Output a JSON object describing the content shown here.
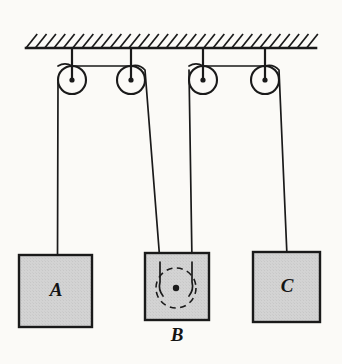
{
  "figure": {
    "background_color": "#fbfaf7",
    "ink_color": "#1a1a1a",
    "block_fill_color": "#d3d3d3",
    "width": 342,
    "height": 364
  },
  "ceiling": {
    "name": "ceiling-support",
    "label": "ceiling",
    "x_left": 26,
    "x_right": 316,
    "y_line": 48,
    "band_height": 14,
    "hatch_count": 31,
    "hatch_direction": "up-right"
  },
  "pulleys": [
    {
      "id": "pulley-1",
      "label": "1",
      "cx": 72,
      "cy": 80,
      "r": 14,
      "hub_r": 2.6,
      "rod_top_y": 48
    },
    {
      "id": "pulley-2",
      "label": "2",
      "cx": 131,
      "cy": 80,
      "r": 14,
      "hub_r": 2.6,
      "rod_top_y": 48
    },
    {
      "id": "pulley-3",
      "label": "3",
      "cx": 203,
      "cy": 80,
      "r": 14,
      "hub_r": 2.6,
      "rod_top_y": 48
    },
    {
      "id": "pulley-4",
      "label": "4",
      "cx": 265,
      "cy": 80,
      "r": 14,
      "hub_r": 2.6,
      "rod_top_y": 48
    }
  ],
  "hidden_pulley": {
    "id": "hidden-pulley-in-B",
    "label": "movable pulley inside B",
    "cx": 176,
    "cy": 288,
    "r": 20,
    "hub_r": 3.2,
    "style": "dashed"
  },
  "strings": [
    {
      "id": "string-left",
      "label": "string over pulleys 1 and 2",
      "path": "M 58,82 L 57.5,258  M 58,66 A 14,14 0 0 1 72,66 L 131,66 A 14,14 0 0 1 145,70 L 160,262"
    },
    {
      "id": "string-right",
      "label": "string over pulleys 3 and 4",
      "path": "M 189,70 L 192,262  M 189,66 A 14,14 0 0 1 203,66 L 265,66 A 14,14 0 0 1 279,70 L 287,256"
    }
  ],
  "blocks": [
    {
      "id": "block-A",
      "label": "A",
      "x": 19,
      "y": 255,
      "w": 73,
      "h": 72,
      "label_x": 56,
      "label_y": 292,
      "label_position": "inside"
    },
    {
      "id": "block-B",
      "label": "B",
      "x": 145,
      "y": 253,
      "w": 64,
      "h": 67,
      "label_x": 177,
      "label_y": 337,
      "label_position": "below"
    },
    {
      "id": "block-C",
      "label": "C",
      "x": 253,
      "y": 252,
      "w": 67,
      "h": 70,
      "label_x": 287,
      "label_y": 288,
      "label_position": "inside"
    }
  ]
}
